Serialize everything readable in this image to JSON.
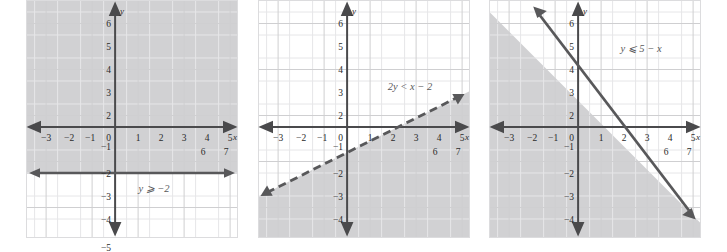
{
  "figure": {
    "kind": "linear-inequality-graphs",
    "panel_count": 3,
    "axis_color": "#4a4a4c",
    "grid_color": "#d0d0d2",
    "grid_minor_color": "#e4e4e6",
    "shade_color": "#c9c9cb",
    "line_color": "#58585a",
    "frame_color": "#dcdcde"
  },
  "chart_data": [
    {
      "id": "panel-1",
      "type": "line",
      "title": "",
      "label": "y ⩾ −2",
      "inequality": "y >= -2",
      "boundary": {
        "style": "solid",
        "inclusive": true,
        "slope": 0,
        "intercept": -2,
        "points": [
          {
            "x": -3.6,
            "y": -2
          },
          {
            "x": 7.6,
            "y": -2
          }
        ]
      },
      "shaded_region": "above",
      "xlabel": "x",
      "ylabel": "y",
      "xlim": [
        -3.8,
        7.8
      ],
      "ylim": [
        -5.8,
        6.8
      ],
      "xticks": [
        -3,
        -2,
        -1,
        0,
        1,
        2,
        3,
        4,
        5,
        6,
        7
      ],
      "yticks": [
        -5,
        -4,
        -3,
        -2,
        -1,
        1,
        2,
        3,
        4,
        5,
        6
      ],
      "xticklabels": [
        "−3",
        "−2",
        "−1",
        "0",
        "1",
        "2",
        "3",
        "4",
        "5",
        "6",
        "7"
      ],
      "yticklabels": [
        "−5",
        "−4",
        "−3",
        "−2",
        "−1",
        "1",
        "2",
        "3",
        "4",
        "5",
        "6"
      ],
      "grid": true,
      "legend": "none"
    },
    {
      "id": "panel-2",
      "type": "line",
      "title": "",
      "label": "2y < x − 2",
      "inequality": "2y < x - 2",
      "boundary": {
        "style": "dashed",
        "inclusive": false,
        "slope": 0.5,
        "intercept": -1,
        "points": [
          {
            "x": -3.7,
            "y": -2.85
          },
          {
            "x": 7.6,
            "y": 2.8
          }
        ]
      },
      "shaded_region": "below",
      "xlabel": "x",
      "ylabel": "y",
      "xlim": [
        -3.8,
        7.8
      ],
      "ylim": [
        -5.8,
        6.8
      ],
      "xticks": [
        -3,
        -2,
        -1,
        0,
        1,
        2,
        3,
        4,
        5,
        6,
        7
      ],
      "yticks": [
        -5,
        -4,
        -3,
        -2,
        -1,
        1,
        2,
        3,
        4,
        5,
        6
      ],
      "xticklabels": [
        "−3",
        "−2",
        "−1",
        "0",
        "1",
        "2",
        "3",
        "4",
        "5",
        "6",
        "7"
      ],
      "yticklabels": [
        "−5",
        "−4",
        "−3",
        "−2",
        "−1",
        "1",
        "2",
        "3",
        "4",
        "5",
        "6"
      ],
      "grid": true,
      "legend": "none"
    },
    {
      "id": "panel-3",
      "type": "line",
      "title": "",
      "label": "y ⩽ 5 − x",
      "inequality": "y <= 5 - x",
      "boundary": {
        "style": "solid",
        "inclusive": true,
        "slope": -1,
        "intercept": 5,
        "points": [
          {
            "x": -1.9,
            "y": 6.9
          },
          {
            "x": 8.0,
            "y": -3.0
          }
        ]
      },
      "shaded_region": "below",
      "xlabel": "x",
      "ylabel": "y",
      "xlim": [
        -3.8,
        7.8
      ],
      "ylim": [
        -5.8,
        6.8
      ],
      "xticks": [
        -3,
        -2,
        -1,
        0,
        1,
        2,
        3,
        4,
        5,
        6,
        7
      ],
      "yticks": [
        -5,
        -4,
        -3,
        -2,
        -1,
        1,
        2,
        3,
        4,
        5,
        6
      ],
      "xticklabels": [
        "−3",
        "−2",
        "−1",
        "0",
        "1",
        "2",
        "3",
        "4",
        "5",
        "6",
        "7"
      ],
      "yticklabels": [
        "−5",
        "−4",
        "−3",
        "−2",
        "−1",
        "1",
        "2",
        "3",
        "4",
        "5",
        "6"
      ],
      "grid": true,
      "legend": "none"
    }
  ]
}
